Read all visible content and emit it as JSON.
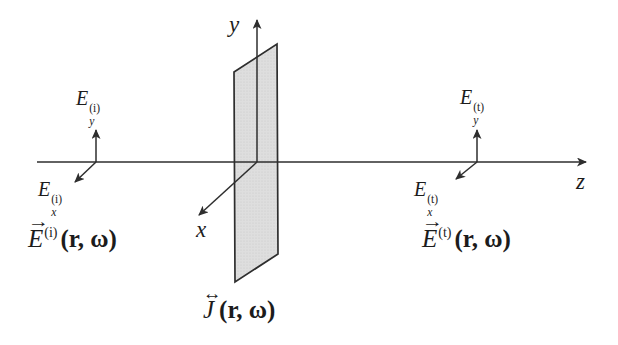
{
  "figure": {
    "axes": {
      "x_label": "x",
      "y_label": "y",
      "z_label": "z"
    },
    "icons": {
      "vector_arrow": "→",
      "dyadic_arrow": "↔"
    },
    "incident": {
      "component_y": {
        "base": "E",
        "sub": "y",
        "sup": "(i)"
      },
      "component_x": {
        "base": "E",
        "sub": "x",
        "sup": "(i)"
      },
      "field": {
        "base": "E",
        "sup": "(i)",
        "args": "(r, ω)"
      }
    },
    "transmitted": {
      "component_y": {
        "base": "E",
        "sub": "y",
        "sup": "(t)"
      },
      "component_x": {
        "base": "E",
        "sub": "x",
        "sup": "(t)"
      },
      "field": {
        "base": "E",
        "sup": "(t)",
        "args": "(r, ω)"
      }
    },
    "current_sheet": {
      "base": "J",
      "args": "(r, ω)"
    },
    "colors": {
      "line": "#2e2e2e",
      "sheet_fill": "#dedede",
      "sheet_dot": "#c8c8c8",
      "background": "#ffffff"
    }
  }
}
